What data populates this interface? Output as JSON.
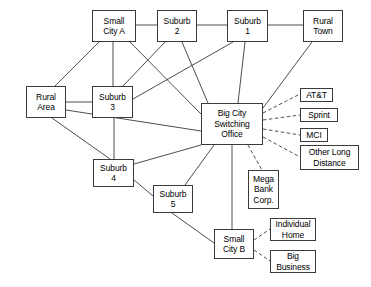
{
  "diagram": {
    "type": "network-node-diagram",
    "background_color": "#ffffff",
    "line_color": "#3a3a3a",
    "border_color": "#3a3a3a",
    "text_color": "#000000",
    "nodes": [
      {
        "id": "small_city_a",
        "label": "Small\nCity A",
        "x": 92,
        "y": 10,
        "w": 44,
        "h": 32
      },
      {
        "id": "suburb2",
        "label": "Suburb\n2",
        "x": 157,
        "y": 10,
        "w": 40,
        "h": 32
      },
      {
        "id": "suburb1",
        "label": "Suburb\n1",
        "x": 227,
        "y": 10,
        "w": 41,
        "h": 32
      },
      {
        "id": "rural_town",
        "label": "Rural\nTown",
        "x": 303,
        "y": 10,
        "w": 40,
        "h": 32
      },
      {
        "id": "rural_area",
        "label": "Rural\nArea",
        "x": 26,
        "y": 86,
        "w": 40,
        "h": 32
      },
      {
        "id": "suburb3",
        "label": "Suburb\n3",
        "x": 92,
        "y": 86,
        "w": 41,
        "h": 32
      },
      {
        "id": "big_city",
        "label": "Big City\nSwitching\nOffice",
        "x": 201,
        "y": 103,
        "w": 62,
        "h": 42
      },
      {
        "id": "att",
        "label": "AT&T",
        "x": 300,
        "y": 88,
        "w": 33,
        "h": 14
      },
      {
        "id": "sprint",
        "label": "Sprint",
        "x": 300,
        "y": 108,
        "w": 38,
        "h": 14
      },
      {
        "id": "mci",
        "label": "MCI",
        "x": 300,
        "y": 128,
        "w": 28,
        "h": 14
      },
      {
        "id": "other_long",
        "label": "Other Long\nDistance",
        "x": 300,
        "y": 145,
        "w": 59,
        "h": 25
      },
      {
        "id": "suburb4",
        "label": "Suburb\n4",
        "x": 93,
        "y": 159,
        "w": 41,
        "h": 28
      },
      {
        "id": "suburb5",
        "label": "Suburb\n5",
        "x": 153,
        "y": 185,
        "w": 40,
        "h": 28
      },
      {
        "id": "mega_bank",
        "label": "Mega\nBank\nCorp.",
        "x": 248,
        "y": 170,
        "w": 31,
        "h": 39
      },
      {
        "id": "small_city_b",
        "label": "Small\nCity B",
        "x": 214,
        "y": 229,
        "w": 40,
        "h": 30
      },
      {
        "id": "individual",
        "label": "Individual\nHome",
        "x": 270,
        "y": 218,
        "w": 46,
        "h": 23
      },
      {
        "id": "big_business",
        "label": "Big\nBusiness",
        "x": 270,
        "y": 250,
        "w": 46,
        "h": 23
      }
    ],
    "edges_solid": [
      {
        "from": "small_city_a",
        "to": "suburb2",
        "x1": 136,
        "y1": 25,
        "x2": 157,
        "y2": 25
      },
      {
        "from": "suburb2",
        "to": "suburb1",
        "x1": 197,
        "y1": 25,
        "x2": 227,
        "y2": 25
      },
      {
        "from": "suburb1",
        "to": "rural_town",
        "x1": 268,
        "y1": 25,
        "x2": 303,
        "y2": 25
      },
      {
        "from": "small_city_a",
        "to": "rural_area",
        "x1": 99,
        "y1": 42,
        "x2": 55,
        "y2": 86
      },
      {
        "from": "small_city_a",
        "to": "suburb3",
        "x1": 113,
        "y1": 42,
        "x2": 113,
        "y2": 86
      },
      {
        "from": "small_city_a",
        "to": "big_city",
        "x1": 130,
        "y1": 42,
        "x2": 201,
        "y2": 114
      },
      {
        "from": "suburb2",
        "to": "suburb3",
        "x1": 165,
        "y1": 42,
        "x2": 123,
        "y2": 86
      },
      {
        "from": "suburb2",
        "to": "big_city",
        "x1": 182,
        "y1": 42,
        "x2": 208,
        "y2": 103
      },
      {
        "from": "suburb1",
        "to": "suburb3",
        "x1": 233,
        "y1": 42,
        "x2": 133,
        "y2": 99
      },
      {
        "from": "suburb1",
        "to": "big_city",
        "x1": 245,
        "y1": 42,
        "x2": 238,
        "y2": 103
      },
      {
        "from": "rural_town",
        "to": "big_city",
        "x1": 312,
        "y1": 42,
        "x2": 263,
        "y2": 108
      },
      {
        "from": "rural_area",
        "to": "suburb3",
        "x1": 66,
        "y1": 102,
        "x2": 92,
        "y2": 102
      },
      {
        "from": "rural_area",
        "to": "big_city",
        "x1": 66,
        "y1": 110,
        "x2": 201,
        "y2": 131
      },
      {
        "from": "rural_area",
        "to": "suburb4",
        "x1": 52,
        "y1": 118,
        "x2": 110,
        "y2": 159
      },
      {
        "from": "suburb3",
        "to": "suburb4",
        "x1": 114,
        "y1": 118,
        "x2": 114,
        "y2": 159
      },
      {
        "from": "suburb4",
        "to": "big_city",
        "x1": 134,
        "y1": 164,
        "x2": 201,
        "y2": 145
      },
      {
        "from": "suburb4",
        "to": "suburb5",
        "x1": 134,
        "y1": 180,
        "x2": 153,
        "y2": 196
      },
      {
        "from": "suburb5",
        "to": "big_city",
        "x1": 185,
        "y1": 185,
        "x2": 214,
        "y2": 145
      },
      {
        "from": "suburb5",
        "to": "small_city_b",
        "x1": 172,
        "y1": 213,
        "x2": 214,
        "y2": 243
      },
      {
        "from": "big_city",
        "to": "small_city_b",
        "x1": 232,
        "y1": 145,
        "x2": 232,
        "y2": 229
      }
    ],
    "edges_dashed": [
      {
        "from": "big_city",
        "to": "att",
        "x1": 263,
        "y1": 113,
        "x2": 300,
        "y2": 94
      },
      {
        "from": "big_city",
        "to": "sprint",
        "x1": 263,
        "y1": 120,
        "x2": 300,
        "y2": 115
      },
      {
        "from": "big_city",
        "to": "mci",
        "x1": 263,
        "y1": 129,
        "x2": 300,
        "y2": 135
      },
      {
        "from": "big_city",
        "to": "other_long",
        "x1": 263,
        "y1": 137,
        "x2": 300,
        "y2": 157
      },
      {
        "from": "big_city",
        "to": "mega_bank",
        "x1": 248,
        "y1": 145,
        "x2": 262,
        "y2": 170
      },
      {
        "from": "small_city_b",
        "to": "individual",
        "x1": 254,
        "y1": 240,
        "x2": 270,
        "y2": 229
      },
      {
        "from": "small_city_b",
        "to": "big_business",
        "x1": 254,
        "y1": 250,
        "x2": 270,
        "y2": 261
      }
    ]
  }
}
